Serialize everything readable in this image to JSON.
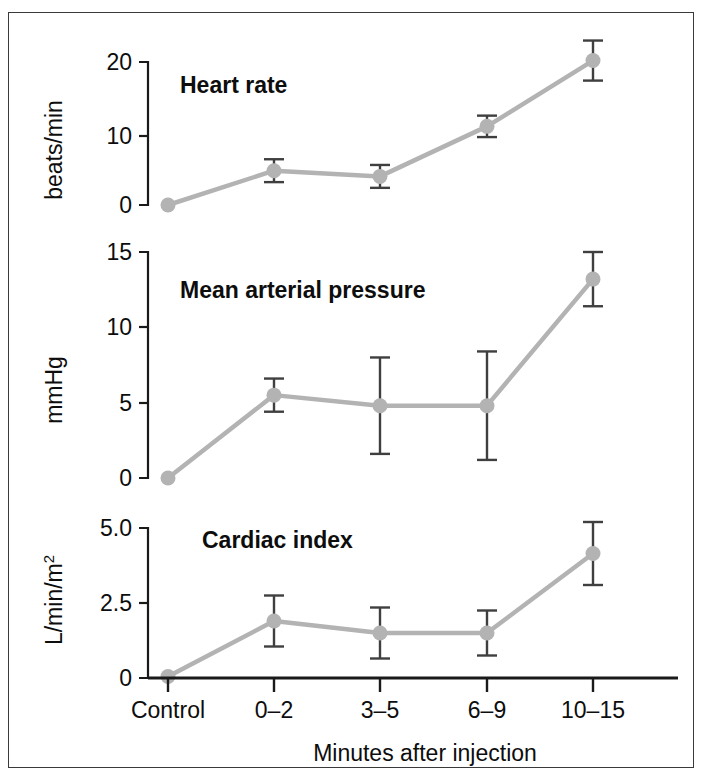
{
  "figure": {
    "xaxis_title": "Minutes after injection",
    "categories": [
      "Control",
      "0–2",
      "3–5",
      "6–9",
      "10–15"
    ],
    "series_color": "#b3b3b3",
    "errorbar_color": "#3f3f3f",
    "axis_color": "#1a1a1a",
    "frame_color": "#3a3a3a"
  },
  "panels": {
    "heart_rate": {
      "title": "Heart rate",
      "ylabel": "beats/min",
      "yticks": [
        "0",
        "10",
        "20"
      ]
    },
    "map": {
      "title": "Mean arterial pressure",
      "ylabel": "mmHg",
      "yticks": [
        "0",
        "5",
        "10",
        "15"
      ]
    },
    "cardiac_index": {
      "title": "Cardiac index",
      "ylabel_main": "L/min/m",
      "ylabel_sup": "2",
      "yticks": [
        "0",
        "2.5",
        "5.0"
      ]
    }
  },
  "chart_data": [
    {
      "type": "line",
      "title": "Heart rate",
      "xlabel": "Minutes after injection",
      "ylabel": "beats/min",
      "categories": [
        "Control",
        "0–2",
        "3–5",
        "6–9",
        "10–15"
      ],
      "values": [
        0,
        4.8,
        4.0,
        11.0,
        20.2
      ],
      "errors": [
        0,
        1.6,
        1.6,
        1.5,
        2.8
      ],
      "yticks": [
        0,
        10,
        20
      ],
      "ylim": [
        -1.2,
        21.5
      ],
      "grid": false,
      "legend": "none",
      "markers": "filled-circle",
      "errorbars": "symmetric-caps"
    },
    {
      "type": "line",
      "title": "Mean arterial pressure",
      "xlabel": "Minutes after injection",
      "ylabel": "mmHg",
      "categories": [
        "Control",
        "0–2",
        "3–5",
        "6–9",
        "10–15"
      ],
      "values": [
        0,
        5.5,
        4.8,
        4.8,
        13.2
      ],
      "errors": [
        0,
        1.1,
        3.2,
        3.6,
        1.8
      ],
      "yticks": [
        0,
        5,
        10,
        15
      ],
      "ylim": [
        -0.6,
        15.8
      ],
      "grid": false,
      "legend": "none",
      "markers": "filled-circle",
      "errorbars": "symmetric-caps"
    },
    {
      "type": "line",
      "title": "Cardiac index",
      "xlabel": "Minutes after injection",
      "ylabel": "L/min/m2",
      "categories": [
        "Control",
        "0–2",
        "3–5",
        "6–9",
        "10–15"
      ],
      "values": [
        0.05,
        1.9,
        1.5,
        1.5,
        4.15
      ],
      "errors": [
        0,
        0.85,
        0.85,
        0.75,
        1.05
      ],
      "yticks": [
        0,
        2.5,
        5.0
      ],
      "ylim": [
        -0.1,
        5.3
      ],
      "grid": false,
      "legend": "none",
      "markers": "filled-circle",
      "errorbars": "symmetric-caps"
    }
  ]
}
